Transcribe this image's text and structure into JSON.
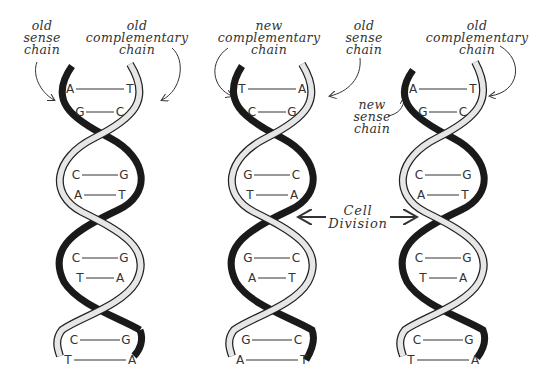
{
  "diagram": {
    "helices": [
      {
        "id": "left",
        "labels": [
          {
            "lines": [
              "old",
              "sense",
              "chain"
            ]
          },
          {
            "lines": [
              "old",
              "complementary",
              "chain"
            ]
          }
        ],
        "pairs": [
          [
            "A",
            "T"
          ],
          [
            "G",
            "C"
          ],
          [
            "C",
            "G"
          ],
          [
            "A",
            "T"
          ],
          [
            "C",
            "G"
          ],
          [
            "T",
            "A"
          ],
          [
            "C",
            "G"
          ],
          [
            "T",
            "A"
          ]
        ]
      },
      {
        "id": "middle",
        "labels": [
          {
            "lines": [
              "new",
              "complementary",
              "chain"
            ]
          },
          {
            "lines": [
              "old",
              "sense",
              "chain"
            ]
          }
        ],
        "pairs": [
          [
            "T",
            "A"
          ],
          [
            "C",
            "G"
          ],
          [
            "G",
            "C"
          ],
          [
            "T",
            "A"
          ],
          [
            "G",
            "C"
          ],
          [
            "A",
            "T"
          ],
          [
            "G",
            "C"
          ],
          [
            "A",
            "T"
          ]
        ]
      },
      {
        "id": "right",
        "labels": [
          {
            "lines": [
              "old",
              "complementary",
              "chain"
            ]
          },
          {
            "lines": [
              "new",
              "sense",
              "chain"
            ]
          }
        ],
        "pairs": [
          [
            "A",
            "T"
          ],
          [
            "G",
            "C"
          ],
          [
            "C",
            "G"
          ],
          [
            "A",
            "T"
          ],
          [
            "C",
            "G"
          ],
          [
            "T",
            "A"
          ],
          [
            "C",
            "G"
          ],
          [
            "T",
            "A"
          ]
        ]
      }
    ],
    "center_label": {
      "lines": [
        "Cell",
        "Division"
      ]
    },
    "colors": {
      "dark_strand": "#1a1a1a",
      "light_strand": "#e6e6e6",
      "outline": "#222222"
    }
  }
}
